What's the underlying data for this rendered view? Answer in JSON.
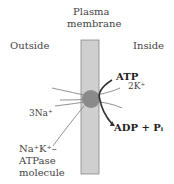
{
  "title": {
    "line1": "Plasma",
    "line2": "membrane"
  },
  "outside_label": "Outside",
  "inside_label": "Inside",
  "atp_label": "ATP",
  "k_label": "2K⁺",
  "na_label": "3Na⁺",
  "products_label": "ADP + Pᵢ",
  "pump": {
    "line1": "Na⁺K⁺–",
    "line2": "ATPase",
    "line3": "molecule"
  },
  "colors": {
    "membrane": "#c8c8c8",
    "pump": "#8a8a8a",
    "lines": "#666666"
  }
}
